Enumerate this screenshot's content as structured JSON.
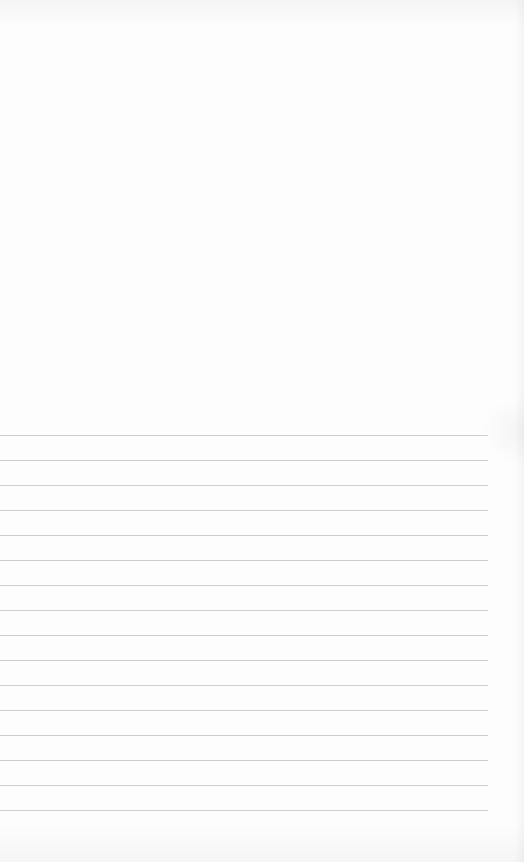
{
  "document": {
    "type": "lined-notepaper",
    "blank_top_area": true,
    "ruled_lines": {
      "count": 16,
      "first_y": 435,
      "spacing": 25,
      "left_x": 0,
      "right_x": 488,
      "color": "#cfcfcf"
    },
    "paper_color": "#fdfdfd"
  }
}
